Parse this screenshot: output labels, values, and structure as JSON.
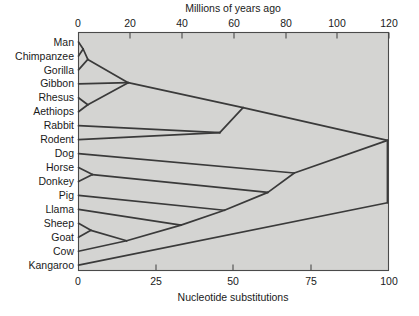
{
  "figure": {
    "background_color": "#ffffff",
    "plot_background_color": "#d4d4d2",
    "frame_color": "#4a4a4a",
    "branch_color": "#3a3a3a"
  },
  "chart_data": {
    "type": "line",
    "title": "",
    "subtitle": "",
    "top_axis": {
      "label": "Millions of years ago",
      "ticks": [
        0,
        20,
        40,
        60,
        80,
        100,
        120
      ],
      "tick_labels": [
        "0",
        "20",
        "40",
        "60",
        "80",
        "100",
        "120"
      ],
      "range": [
        0,
        120
      ],
      "position": "top"
    },
    "bottom_axis": {
      "label": "Nucleotide substitutions",
      "ticks": [
        0,
        25,
        50,
        75,
        100
      ],
      "tick_labels": [
        "0",
        "25",
        "50",
        "75",
        "100"
      ],
      "range": [
        0,
        100
      ],
      "position": "bottom"
    },
    "grid": false,
    "legend": null,
    "taxa": [
      "Man",
      "Chimpanzee",
      "Gorilla",
      "Gibbon",
      "Rhesus",
      "Aethiops",
      "Rabbit",
      "Rodent",
      "Dog",
      "Horse",
      "Donkey",
      "Pig",
      "Llama",
      "Sheep",
      "Goat",
      "Cow",
      "Kangaroo"
    ],
    "xlabel": "Nucleotide substitutions",
    "ylabel": "",
    "x": [
      0,
      25,
      50,
      75,
      100
    ],
    "values": [
      0,
      25,
      50,
      75,
      100
    ],
    "nodes": [
      {
        "name": "man-chimp",
        "x": 1.5,
        "children": [
          "Man",
          "Chimpanzee"
        ]
      },
      {
        "name": "man-chimp-gorilla",
        "x": 3.0,
        "children": [
          "man-chimp",
          "Gorilla"
        ]
      },
      {
        "name": "rhesus-aethiops",
        "x": 3.0,
        "children": [
          "Rhesus",
          "Aethiops"
        ]
      },
      {
        "name": "catarrhines",
        "x": 16.0,
        "children": [
          "man-chimp-gorilla",
          "Gibbon",
          "rhesus-aethiops"
        ]
      },
      {
        "name": "rabbit-rodent",
        "x": 45.5,
        "children": [
          "Rabbit",
          "Rodent"
        ]
      },
      {
        "name": "euarchontoglires",
        "x": 53.0,
        "children": [
          "catarrhines",
          "rabbit-rodent"
        ]
      },
      {
        "name": "horse-donkey",
        "x": 4.5,
        "children": [
          "Horse",
          "Donkey"
        ]
      },
      {
        "name": "sheep-goat",
        "x": 4.0,
        "children": [
          "Sheep",
          "Goat"
        ]
      },
      {
        "name": "sheep-goat-cow",
        "x": 15.5,
        "children": [
          "sheep-goat",
          "Cow"
        ]
      },
      {
        "name": "ruminant-llama",
        "x": 33.0,
        "children": [
          "sheep-goat-cow",
          "Llama"
        ]
      },
      {
        "name": "artiodactyls",
        "x": 47.0,
        "children": [
          "ruminant-llama",
          "Pig"
        ]
      },
      {
        "name": "perisso-artiodactyl",
        "x": 61.0,
        "children": [
          "artiodactyls",
          "horse-donkey"
        ]
      },
      {
        "name": "laurasiatheria",
        "x": 69.5,
        "children": [
          "perisso-artiodactyl",
          "Dog"
        ]
      },
      {
        "name": "placentalia",
        "x": 99.5,
        "children": [
          "euarchontoglires",
          "laurasiatheria"
        ]
      },
      {
        "name": "root",
        "x": 99.5,
        "children": [
          "placentalia",
          "Kangaroo"
        ]
      }
    ]
  }
}
